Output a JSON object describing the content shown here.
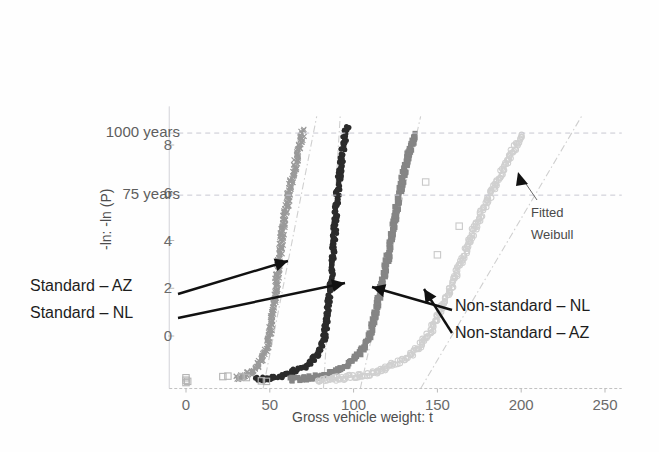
{
  "chart_data": {
    "type": "scatter",
    "title": "",
    "xlabel": "Gross vehicle weight: t",
    "ylabel": "-ln: -ln (P)",
    "xlim": [
      -10,
      260
    ],
    "ylim": [
      -2.2,
      9.2
    ],
    "xticks": [
      0,
      50,
      100,
      150,
      200,
      250
    ],
    "xtick_labels": [
      "0",
      "50",
      "100",
      "150",
      "200",
      "250"
    ],
    "yticks": [
      0,
      2,
      4,
      6,
      8
    ],
    "ytick_labels": [
      "0",
      "2",
      "4",
      "6",
      "8"
    ],
    "grid": "horizontal-dashed-return-period-lines-only",
    "legend": "none-inline-annotations",
    "return_period_lines": [
      {
        "label": "75 years",
        "y": 5.9
      },
      {
        "label": "1000 years",
        "y": 8.5
      }
    ],
    "annotations": [
      {
        "text": "Standard – AZ",
        "target_series": "Standard - AZ"
      },
      {
        "text": "Standard – NL",
        "target_series": "Standard - NL"
      },
      {
        "text": "Non-standard – NL",
        "target_series": "Non-standard - NL"
      },
      {
        "text": "Non-standard – AZ",
        "target_series": "Non-standard - AZ"
      },
      {
        "text": "Fitted Weibull",
        "target_series": "fitted-weibull-line"
      }
    ],
    "series": [
      {
        "name": "Standard - AZ",
        "color": "#9a9a9a",
        "marker": "cross",
        "points": [
          [
            30,
            -1.75
          ],
          [
            34,
            -1.72
          ],
          [
            37,
            -1.6
          ],
          [
            40,
            -1.45
          ],
          [
            42,
            -1.3
          ],
          [
            44,
            -1.15
          ],
          [
            45,
            -1.0
          ],
          [
            46,
            -0.85
          ],
          [
            47,
            -0.7
          ],
          [
            48,
            -0.55
          ],
          [
            48.5,
            -0.4
          ],
          [
            49,
            -0.25
          ],
          [
            49.5,
            -0.1
          ],
          [
            50,
            0.1
          ],
          [
            50.5,
            0.3
          ],
          [
            51,
            0.5
          ],
          [
            51.5,
            0.75
          ],
          [
            52,
            1.0
          ],
          [
            52.5,
            1.3
          ],
          [
            53,
            1.6
          ],
          [
            53.5,
            1.9
          ],
          [
            54,
            2.2
          ],
          [
            54.5,
            2.5
          ],
          [
            55,
            2.8
          ],
          [
            55.5,
            3.1
          ],
          [
            56,
            3.4
          ],
          [
            56.5,
            3.7
          ],
          [
            57,
            4.0
          ],
          [
            57.5,
            4.3
          ],
          [
            58,
            4.6
          ],
          [
            59,
            5.0
          ],
          [
            60,
            5.4
          ],
          [
            61,
            5.8
          ],
          [
            62,
            6.2
          ],
          [
            64,
            6.8
          ],
          [
            66,
            7.4
          ],
          [
            68,
            8.0
          ],
          [
            70,
            8.6
          ]
        ]
      },
      {
        "name": "Standard - NL",
        "color": "#2b2b2b",
        "marker": "circle",
        "points": [
          [
            42,
            -1.8
          ],
          [
            48,
            -1.78
          ],
          [
            54,
            -1.72
          ],
          [
            60,
            -1.6
          ],
          [
            65,
            -1.45
          ],
          [
            70,
            -1.3
          ],
          [
            74,
            -1.1
          ],
          [
            77,
            -0.9
          ],
          [
            79,
            -0.7
          ],
          [
            80.5,
            -0.5
          ],
          [
            81.5,
            -0.3
          ],
          [
            82.5,
            -0.1
          ],
          [
            83,
            0.15
          ],
          [
            83.5,
            0.4
          ],
          [
            84,
            0.7
          ],
          [
            84.5,
            1.0
          ],
          [
            85,
            1.3
          ],
          [
            85.5,
            1.6
          ],
          [
            86,
            1.9
          ],
          [
            86.3,
            2.2
          ],
          [
            86.6,
            2.5
          ],
          [
            87,
            2.8
          ],
          [
            87.3,
            3.1
          ],
          [
            87.6,
            3.4
          ],
          [
            88,
            3.7
          ],
          [
            88.4,
            4.1
          ],
          [
            88.8,
            4.5
          ],
          [
            89.5,
            5.2
          ],
          [
            90.5,
            6.0
          ],
          [
            92,
            7.0
          ],
          [
            94,
            8.0
          ],
          [
            96,
            8.8
          ]
        ]
      },
      {
        "name": "Non-standard - NL",
        "color": "#858585",
        "marker": "square",
        "points": [
          [
            62,
            -1.82
          ],
          [
            70,
            -1.78
          ],
          [
            78,
            -1.7
          ],
          [
            85,
            -1.6
          ],
          [
            90,
            -1.45
          ],
          [
            95,
            -1.25
          ],
          [
            99,
            -1.05
          ],
          [
            102,
            -0.85
          ],
          [
            105,
            -0.6
          ],
          [
            107,
            -0.35
          ],
          [
            109,
            -0.1
          ],
          [
            110,
            0.15
          ],
          [
            111,
            0.4
          ],
          [
            112,
            0.7
          ],
          [
            113,
            1.0
          ],
          [
            114,
            1.3
          ],
          [
            115,
            1.6
          ],
          [
            116,
            1.9
          ],
          [
            117,
            2.2
          ],
          [
            118,
            2.5
          ],
          [
            119,
            2.8
          ],
          [
            120,
            3.1
          ],
          [
            121,
            3.5
          ],
          [
            122,
            3.9
          ],
          [
            123,
            4.3
          ],
          [
            124,
            4.7
          ],
          [
            125,
            5.1
          ],
          [
            126,
            5.5
          ],
          [
            128,
            6.1
          ],
          [
            130,
            6.8
          ],
          [
            133,
            7.6
          ],
          [
            136,
            8.4
          ]
        ]
      },
      {
        "name": "Non-standard - AZ",
        "color": "#d0d0d0",
        "marker": "circle-open",
        "points": [
          [
            78,
            -1.85
          ],
          [
            88,
            -1.8
          ],
          [
            98,
            -1.72
          ],
          [
            108,
            -1.6
          ],
          [
            116,
            -1.45
          ],
          [
            122,
            -1.25
          ],
          [
            128,
            -1.05
          ],
          [
            133,
            -0.85
          ],
          [
            137,
            -0.6
          ],
          [
            140,
            -0.35
          ],
          [
            143,
            -0.1
          ],
          [
            146,
            0.2
          ],
          [
            148,
            0.5
          ],
          [
            150,
            0.8
          ],
          [
            152,
            1.1
          ],
          [
            154,
            1.4
          ],
          [
            156,
            1.7
          ],
          [
            158,
            2.0
          ],
          [
            160,
            2.35
          ],
          [
            162,
            2.7
          ],
          [
            164,
            3.0
          ],
          [
            166,
            3.4
          ],
          [
            168,
            3.8
          ],
          [
            171,
            4.3
          ],
          [
            174,
            4.8
          ],
          [
            178,
            5.4
          ],
          [
            182,
            6.0
          ],
          [
            188,
            6.8
          ],
          [
            194,
            7.6
          ],
          [
            200,
            8.4
          ]
        ]
      },
      {
        "name": "low-weight-cluster",
        "color": "#b5b5b5",
        "marker": "square-open",
        "points": [
          [
            0,
            -1.95
          ],
          [
            0,
            -1.85
          ],
          [
            0,
            -1.75
          ],
          [
            1,
            -1.9
          ],
          [
            22,
            -1.7
          ],
          [
            25,
            -1.68
          ],
          [
            33,
            -1.72
          ],
          [
            36,
            -1.74
          ],
          [
            45,
            -1.88
          ],
          [
            48,
            -1.9
          ]
        ]
      },
      {
        "name": "outliers",
        "color": "#c9c9c9",
        "marker": "square-open",
        "points": [
          [
            143,
            6.45
          ],
          [
            163,
            4.6
          ],
          [
            150,
            3.4
          ]
        ]
      }
    ],
    "fitted_weibull_lines": [
      {
        "name": "fit-standard-az",
        "x0": 46,
        "y0": -2.2,
        "x1": 78,
        "y1": 9.2
      },
      {
        "name": "fit-standard-nl",
        "x0": 82,
        "y0": -2.2,
        "x1": 92,
        "y1": 9.2
      },
      {
        "name": "fit-non-standard-nl",
        "x0": 104,
        "y0": -2.2,
        "x1": 140,
        "y1": 9.2
      },
      {
        "name": "fit-non-standard-az",
        "x0": 140,
        "y0": -2.2,
        "x1": 236,
        "y1": 9.2
      }
    ]
  }
}
